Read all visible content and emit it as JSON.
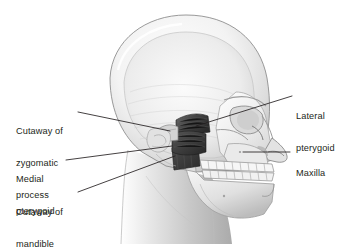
{
  "figure": {
    "type": "anatomical-illustration",
    "background_color": "#ffffff",
    "label_color": "#231f20",
    "leader_color": "#231f20",
    "bone_light": "#f2f2f2",
    "bone_mid": "#c9c9c9",
    "bone_shadow": "#9a9a9a",
    "skin_light": "#e9e9e9",
    "skin_mid": "#c2c2c2",
    "muscle_dark": "#4a4a4a",
    "muscle_darker": "#2e2e2e"
  },
  "labels": {
    "zygomatic": {
      "name": "cutaway-of-zygomatic-process",
      "lines": [
        "Cutaway of",
        "zygomatic",
        "process"
      ],
      "line1": "Cutaway of",
      "line2": "zygomatic",
      "line3": "process",
      "side": "left"
    },
    "medial_pterygoid": {
      "name": "medial-pterygoid",
      "lines": [
        "Medial",
        "pterygoid"
      ],
      "line1": "Medial",
      "line2": "pterygoid",
      "side": "left"
    },
    "mandible": {
      "name": "cutaway-of-mandible",
      "lines": [
        "Cutaway of",
        "mandible"
      ],
      "line1": "Cutaway of",
      "line2": "mandible",
      "side": "left"
    },
    "lateral_pterygoid": {
      "name": "lateral-pterygoid",
      "lines": [
        "Lateral",
        "pterygoid"
      ],
      "line1": "Lateral",
      "line2": "pterygoid",
      "side": "right"
    },
    "maxilla": {
      "name": "maxilla",
      "lines": [
        "Maxilla"
      ],
      "line1": "Maxilla",
      "side": "right"
    }
  }
}
